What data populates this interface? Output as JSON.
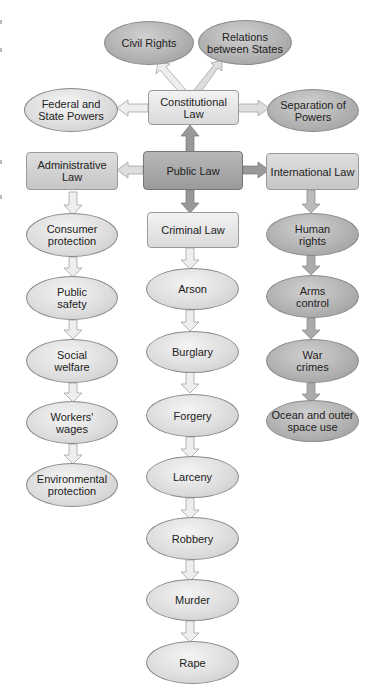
{
  "diagram": {
    "root": {
      "label": "Public Law"
    },
    "constitutional": {
      "label": "Constitutional Law",
      "children": [
        {
          "label": "Civil Rights"
        },
        {
          "label": "Relations between States"
        },
        {
          "label": "Federal and State Powers"
        },
        {
          "label": "Separation of Powers"
        }
      ]
    },
    "administrative": {
      "label": "Administrative Law",
      "children": [
        {
          "label": "Consumer protection"
        },
        {
          "label": "Public safety"
        },
        {
          "label": "Social welfare"
        },
        {
          "label": "Workers' wages"
        },
        {
          "label": "Environmental protection"
        }
      ]
    },
    "criminal": {
      "label": "Criminal Law",
      "children": [
        {
          "label": "Arson"
        },
        {
          "label": "Burglary"
        },
        {
          "label": "Forgery"
        },
        {
          "label": "Larceny"
        },
        {
          "label": "Robbery"
        },
        {
          "label": "Murder"
        },
        {
          "label": "Rape"
        }
      ]
    },
    "international": {
      "label": "International Law",
      "children": [
        {
          "label": "Human rights"
        },
        {
          "label": "Arms control"
        },
        {
          "label": "War crimes"
        },
        {
          "label": "Ocean and outer space use"
        }
      ]
    }
  }
}
